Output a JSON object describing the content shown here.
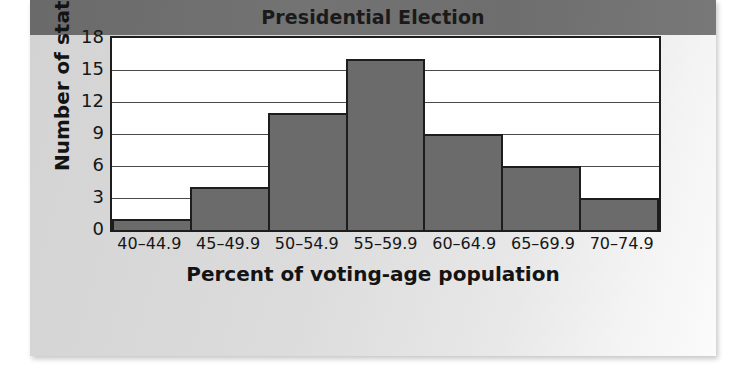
{
  "chart_data": {
    "type": "bar",
    "title": "Presidential Election",
    "xlabel": "Percent of voting-age population",
    "ylabel": "Number of states",
    "categories": [
      "40–44.9",
      "45–49.9",
      "50–54.9",
      "55–59.9",
      "60–64.9",
      "65–69.9",
      "70–74.9"
    ],
    "values": [
      1,
      4,
      11,
      16,
      9,
      6,
      3
    ],
    "yticks": [
      "0",
      "3",
      "6",
      "9",
      "12",
      "15",
      "18"
    ],
    "ytick_values": [
      0,
      3,
      6,
      9,
      12,
      15,
      18
    ],
    "ylim": [
      0,
      18
    ],
    "grid": true,
    "legend": "none",
    "colors": {
      "bar_fill": "#6b6b6b",
      "bar_outline": "#1d1d1d",
      "title_band": "#6d6d6d",
      "panel_background": "#dcdcdc",
      "plot_background": "#ffffff",
      "text": "#131313"
    }
  }
}
